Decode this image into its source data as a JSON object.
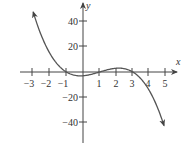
{
  "chart_data": {
    "type": "line",
    "title": "",
    "xlabel": "x",
    "ylabel": "y",
    "function": "y = -(x+1)(x-1)(x-3)",
    "x_ticks": [
      -3,
      -2,
      -1,
      1,
      2,
      3,
      4,
      5
    ],
    "x_tick_labels": [
      "−3",
      "−2",
      "−1",
      "1",
      "2",
      "3",
      "4",
      "5"
    ],
    "y_ticks": [
      40,
      20,
      -20,
      -40
    ],
    "y_tick_labels": [
      "40",
      "20",
      "−20",
      "−40"
    ],
    "xlim": [
      -3.6,
      5.7
    ],
    "ylim": [
      -56,
      55
    ],
    "grid": false,
    "legend": "none",
    "series": [
      {
        "name": "f(x)",
        "x": [
          -3,
          -2.5,
          -2,
          -1.5,
          -1,
          -0.5,
          0,
          0.5,
          1,
          1.5,
          2,
          2.5,
          3,
          3.5,
          4,
          4.5,
          4.9
        ],
        "values": [
          48,
          26.25,
          15,
          5.63,
          0,
          -2.63,
          -3,
          -1.88,
          0,
          1.88,
          3,
          2.63,
          0,
          -5.63,
          -15,
          -26.25,
          -43.3
        ]
      }
    ],
    "arrows": {
      "curve_start": true,
      "curve_end": true,
      "x_axis": true,
      "y_axis": true
    }
  },
  "labels": {
    "x_axis": "x",
    "y_axis": "y"
  }
}
